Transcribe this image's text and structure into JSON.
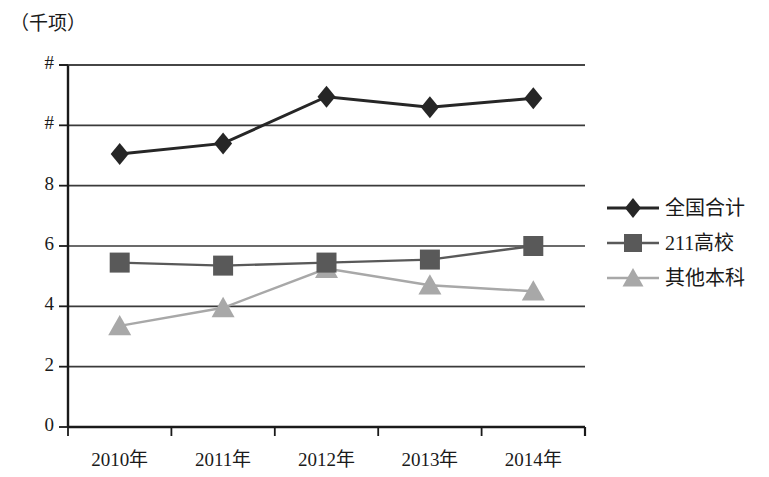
{
  "chart_data": {
    "type": "line",
    "title": "（千项）",
    "xlabel": "",
    "ylabel": "（千项）",
    "categories": [
      "2010年",
      "2011年",
      "2012年",
      "2013年",
      "2014年"
    ],
    "ytick_labels": [
      "0",
      "2",
      "4",
      "6",
      "8",
      "#",
      "#"
    ],
    "ytick_values": [
      0,
      2,
      4,
      6,
      8,
      10,
      12
    ],
    "ylim": [
      0,
      12
    ],
    "grid": "horizontal",
    "legend_position": "right",
    "series": [
      {
        "name": "全国合计",
        "marker": "diamond",
        "color": "#262626",
        "values": [
          9.05,
          9.4,
          10.95,
          10.6,
          10.9
        ]
      },
      {
        "name": "211高校",
        "marker": "square",
        "color": "#595959",
        "values": [
          5.45,
          5.35,
          5.45,
          5.55,
          6.0
        ]
      },
      {
        "name": "其他本科",
        "marker": "triangle",
        "color": "#a8a8a8",
        "values": [
          3.35,
          3.95,
          5.25,
          4.7,
          4.5
        ]
      }
    ]
  },
  "legend": {
    "items": [
      {
        "label": "全国合计",
        "marker": "diamond",
        "color": "#262626"
      },
      {
        "label": "211高校",
        "marker": "square",
        "color": "#595959"
      },
      {
        "label": "其他本科",
        "marker": "triangle",
        "color": "#a8a8a8"
      }
    ]
  },
  "axes": {
    "unit_label": "（千项）"
  }
}
